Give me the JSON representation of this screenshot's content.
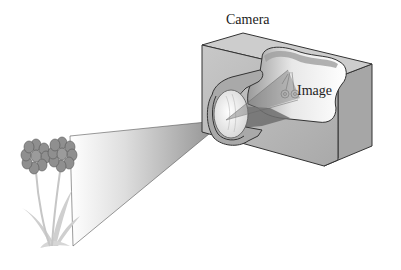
{
  "diagram": {
    "labels": {
      "camera": "Camera",
      "image": "Image"
    },
    "elements": [
      {
        "id": "object",
        "description": "Two flowers on stems with leaves (the object)"
      },
      {
        "id": "light-cone",
        "description": "Gray cone of light from flowers converging at the lens"
      },
      {
        "id": "camera-body",
        "description": "Cutaway box-shaped camera body"
      },
      {
        "id": "lens",
        "description": "Convex lens in cylindrical barrel"
      },
      {
        "id": "image",
        "description": "Small inverted image of flowers on back of camera"
      }
    ],
    "colors": {
      "background": "#ffffff",
      "camera_front": "#b4b4b4",
      "camera_side": "#a2a2a2",
      "camera_top": "#cfcfcf",
      "interior_light": "#f2f2f2",
      "flower": "#8c8c8c",
      "stem": "#c9c9c9",
      "outline": "#3a3a3a"
    }
  }
}
